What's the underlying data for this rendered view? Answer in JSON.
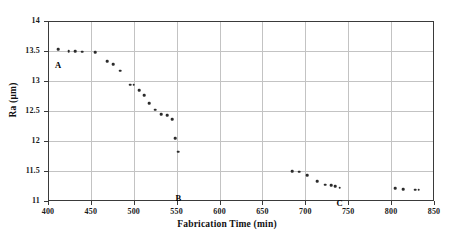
{
  "chart_data": {
    "type": "scatter",
    "title": "",
    "xlabel": "Fabrication Time (min)",
    "ylabel": "Ra (µm)",
    "xlim": [
      400,
      850
    ],
    "ylim": [
      11,
      14
    ],
    "xticks": [
      400,
      450,
      500,
      550,
      600,
      650,
      700,
      750,
      800,
      850
    ],
    "yticks": [
      11,
      11.5,
      12,
      12.5,
      13,
      13.5,
      14
    ],
    "xtick_labels": [
      "400",
      "450",
      "500",
      "550",
      "600",
      "650",
      "700",
      "750",
      "800",
      "850"
    ],
    "ytick_labels": [
      "11",
      "11.5",
      "12",
      "12.5",
      "13",
      "13.5",
      "14"
    ],
    "grid": true,
    "legend": "none",
    "marker": "dot",
    "marker_color": "#2b2b2b",
    "series": [
      {
        "name": "Ra",
        "x": [
          412,
          424,
          432,
          440,
          455,
          469,
          476,
          484,
          496,
          500,
          506,
          512,
          518,
          525,
          532,
          539,
          545,
          548,
          552,
          685,
          693,
          702,
          714,
          723,
          730,
          735,
          740,
          805,
          814,
          828,
          832
        ],
        "y": [
          13.53,
          13.5,
          13.5,
          13.49,
          13.48,
          13.33,
          13.28,
          13.17,
          12.94,
          12.94,
          12.85,
          12.76,
          12.63,
          12.52,
          12.45,
          12.43,
          12.36,
          12.05,
          11.82,
          11.5,
          11.49,
          11.43,
          11.33,
          11.27,
          11.26,
          11.25,
          11.22,
          11.21,
          11.2,
          11.19,
          11.19
        ]
      }
    ],
    "annotations": [
      {
        "label": "A",
        "x": 412,
        "y": 13.53,
        "dx": 0,
        "dy": 11
      },
      {
        "label": "B",
        "x": 552,
        "y": 11.3,
        "dx": 0,
        "dy": 10
      },
      {
        "label": "C",
        "x": 740,
        "y": 11.22,
        "dx": 0,
        "dy": 10
      }
    ]
  }
}
